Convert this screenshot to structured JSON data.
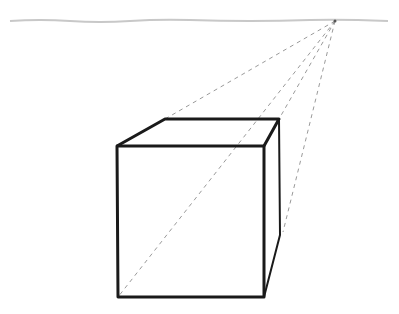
{
  "diagram": {
    "colors": {
      "background": "#ffffff",
      "horizon": "#c8c8c8",
      "construction": "#9a9a9a",
      "edges": "#1a1a1a"
    },
    "horizon": {
      "x1": 10,
      "y1": 21,
      "x2": 388,
      "y2": 21
    },
    "vanishing_point": {
      "x": 335,
      "y": 21
    },
    "cube": {
      "front_top_left": [
        117,
        146
      ],
      "front_top_right": [
        264,
        146
      ],
      "front_bottom_left": [
        118,
        297
      ],
      "front_bottom_right": [
        264,
        297
      ],
      "back_top_left": [
        165,
        119
      ],
      "back_top_right": [
        279,
        119
      ],
      "back_right_mid": [
        280,
        235
      ]
    }
  }
}
